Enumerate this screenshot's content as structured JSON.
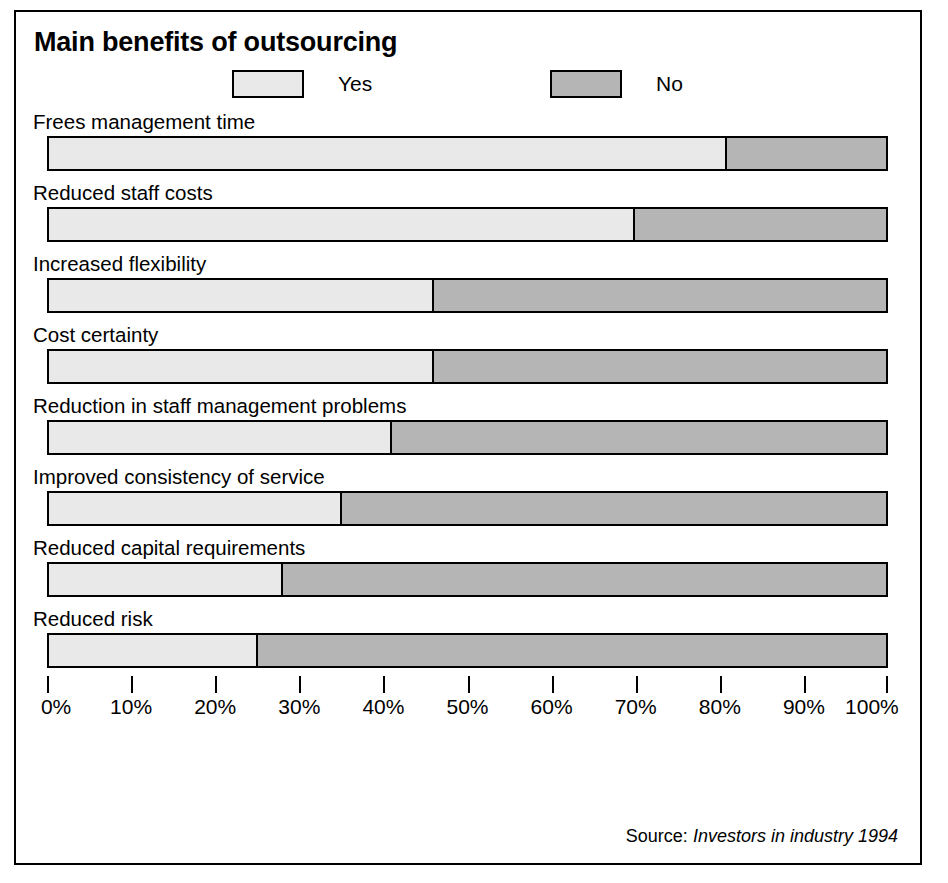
{
  "chart_data": {
    "type": "bar",
    "orientation": "horizontal",
    "stacked": true,
    "title": "Main benefits of outsourcing",
    "xlabel": "",
    "ylabel": "",
    "xlim": [
      0,
      100
    ],
    "grid": false,
    "legend_position": "top",
    "categories": [
      "Frees management time",
      "Reduced staff costs",
      "Increased flexibility",
      "Cost certainty",
      "Reduction in staff management problems",
      "Improved consistency of service",
      "Reduced capital requirements",
      "Reduced risk"
    ],
    "series": [
      {
        "name": "Yes",
        "color": "#e9e9e9",
        "values": [
          81,
          70,
          46,
          46,
          41,
          35,
          28,
          25
        ]
      },
      {
        "name": "No",
        "color": "#b5b5b5",
        "values": [
          19,
          30,
          54,
          54,
          59,
          65,
          72,
          75
        ]
      }
    ],
    "tick_labels": [
      "0%",
      "10%",
      "20%",
      "30%",
      "40%",
      "50%",
      "60%",
      "70%",
      "80%",
      "90%",
      "100%"
    ],
    "tick_values": [
      0,
      10,
      20,
      30,
      40,
      50,
      60,
      70,
      80,
      90,
      100
    ]
  },
  "legend": {
    "items": [
      {
        "label": "Yes",
        "color": "#e9e9e9"
      },
      {
        "label": "No",
        "color": "#b5b5b5"
      }
    ]
  },
  "source": {
    "label": "Source:",
    "value": "Investors in industry 1994"
  }
}
